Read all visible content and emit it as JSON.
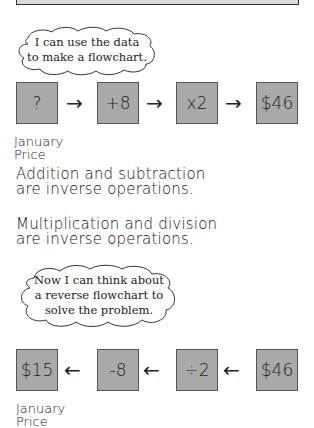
{
  "cloud1": {
    "lines": [
      "I can use the data",
      "to make a flowchart."
    ]
  },
  "forward_flow": {
    "boxes": [
      "?",
      "+8",
      "x2",
      "$46"
    ],
    "arrow": "→",
    "caption": [
      "January",
      "Price"
    ]
  },
  "notes": {
    "addition": [
      "Addition and subtraction",
      "are inverse operations."
    ],
    "multiplication": [
      "Multiplication and division",
      "are inverse operations."
    ]
  },
  "cloud2": {
    "lines": [
      "Now I can think about",
      "a reverse flowchart to",
      "solve the problem."
    ]
  },
  "reverse_flow": {
    "boxes": [
      "$15",
      "-8",
      "÷2",
      "$46"
    ],
    "arrow": "←",
    "caption": [
      "January",
      "Price"
    ]
  },
  "colors": {
    "box_fill": "#a9a9a9",
    "box_border": "#555555"
  }
}
